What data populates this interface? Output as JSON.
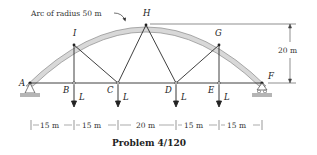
{
  "figure": {
    "caption": "Problem 4/120",
    "arc_label": "Arc of radius 50 m",
    "height_dimension": "20 m",
    "joints": {
      "A": "A",
      "B": "B",
      "C": "C",
      "D": "D",
      "E": "E",
      "F": "F",
      "G": "G",
      "H": "H",
      "I": "I"
    },
    "load_label": "L",
    "loads": [
      {
        "joint": "B",
        "label": "L"
      },
      {
        "joint": "C",
        "label": "L"
      },
      {
        "joint": "D",
        "label": "L"
      },
      {
        "joint": "E",
        "label": "L"
      }
    ],
    "spans": [
      "15 m",
      "15 m",
      "20 m",
      "15 m",
      "15 m"
    ],
    "colors": {
      "arch_fill": "#d8d8d8",
      "arch_stroke": "#8a8a8a",
      "ground": "#b5b5b5",
      "line": "#2a2a2a"
    }
  }
}
